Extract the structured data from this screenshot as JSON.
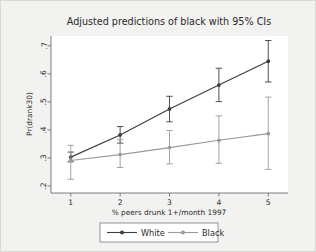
{
  "chart_data": {
    "type": "line",
    "title": "Adjusted predictions of black with 95% CIs",
    "xlabel": "% peers drunk 1+/month 1997",
    "ylabel": "Pr(drank30)",
    "x": [
      1,
      2,
      3,
      4,
      5
    ],
    "xticklabels": [
      "1",
      "2",
      "3",
      "4",
      "5"
    ],
    "yticks": [
      0.2,
      0.3,
      0.4,
      0.5,
      0.6,
      0.7
    ],
    "yticklabels": [
      ".2",
      ".3",
      ".4",
      ".5",
      ".6",
      ".7"
    ],
    "xlim": [
      0.6,
      5.4
    ],
    "ylim": [
      0.175,
      0.735
    ],
    "grid": false,
    "legend_position": "below-axis-centered",
    "series": [
      {
        "name": "White",
        "color": "#3d3d3d",
        "marker": "circle",
        "values": [
          0.303,
          0.382,
          0.475,
          0.56,
          0.645
        ],
        "ci_lower": [
          0.286,
          0.353,
          0.429,
          0.501,
          0.571
        ],
        "ci_upper": [
          0.321,
          0.412,
          0.52,
          0.62,
          0.719
        ]
      },
      {
        "name": "Black",
        "color": "#9a9a9a",
        "marker": "circle",
        "values": [
          0.291,
          0.312,
          0.337,
          0.363,
          0.387
        ],
        "ci_lower": [
          0.224,
          0.266,
          0.279,
          0.281,
          0.259
        ],
        "ci_upper": [
          0.345,
          0.365,
          0.398,
          0.45,
          0.517
        ]
      }
    ]
  },
  "legend": {
    "entries": [
      {
        "label": "White"
      },
      {
        "label": "Black"
      }
    ]
  },
  "colors": {
    "series_white": "#3d3d3d",
    "series_black": "#9a9a9a",
    "axis": "#6f6f6f",
    "plot_background": "#ffffff",
    "figure_background": "#f2f2f0",
    "text": "#2b2b2b"
  }
}
